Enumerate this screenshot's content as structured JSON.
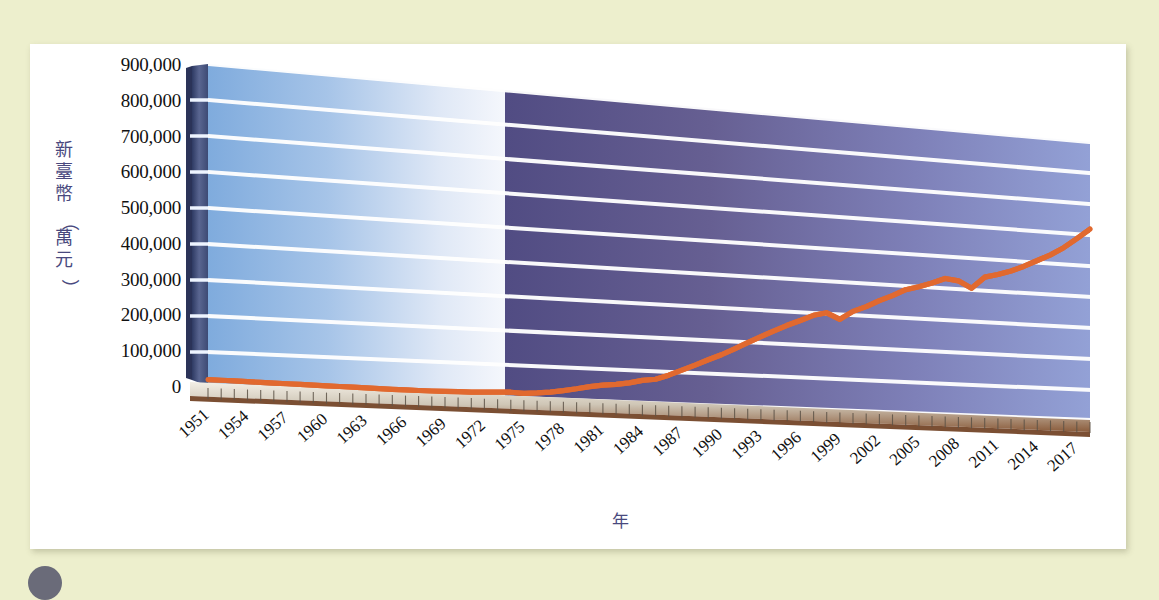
{
  "page": {
    "background_color": "#edefcd",
    "card_color": "#ffffff"
  },
  "chart_data": {
    "type": "line",
    "title": "",
    "subtitle": "",
    "xlabel": "年",
    "ylabel": "新臺幣（萬元）",
    "ylabel_chars": [
      "新",
      "臺",
      "幣",
      "（",
      "萬",
      "元",
      "）"
    ],
    "ylim": [
      0,
      900000
    ],
    "ytick_step": 100000,
    "ytick_labels": [
      "900,000",
      "800,000",
      "700,000",
      "600,000",
      "500,000",
      "400,000",
      "300,000",
      "200,000",
      "100,000",
      "0"
    ],
    "ytick_values": [
      900000,
      800000,
      700000,
      600000,
      500000,
      400000,
      300000,
      200000,
      100000,
      0
    ],
    "xtick_labels": [
      "1951",
      "1954",
      "1957",
      "1960",
      "1963",
      "1966",
      "1969",
      "1972",
      "1975",
      "1978",
      "1981",
      "1984",
      "1987",
      "1990",
      "1993",
      "1996",
      "1999",
      "2002",
      "2005",
      "2008",
      "2011",
      "2014",
      "2017"
    ],
    "xlim": [
      1951,
      2018
    ],
    "grid": true,
    "legend": "none",
    "series_color": "#e1692f",
    "series": [
      {
        "name": "新臺幣（萬元）",
        "x": [
          1951,
          1952,
          1953,
          1954,
          1955,
          1956,
          1957,
          1958,
          1959,
          1960,
          1961,
          1962,
          1963,
          1964,
          1965,
          1966,
          1967,
          1968,
          1969,
          1970,
          1971,
          1972,
          1973,
          1974,
          1975,
          1976,
          1977,
          1978,
          1979,
          1980,
          1981,
          1982,
          1983,
          1984,
          1985,
          1986,
          1987,
          1988,
          1989,
          1990,
          1991,
          1992,
          1993,
          1994,
          1995,
          1996,
          1997,
          1998,
          1999,
          2000,
          2001,
          2002,
          2003,
          2004,
          2005,
          2006,
          2007,
          2008,
          2009,
          2010,
          2011,
          2012,
          2013,
          2014,
          2015,
          2016,
          2017,
          2018
        ],
        "values": [
          18000,
          17500,
          17000,
          16500,
          16000,
          15500,
          15000,
          14500,
          14000,
          13500,
          13000,
          12500,
          12000,
          11500,
          11000,
          10500,
          10500,
          10500,
          11000,
          11500,
          12000,
          13000,
          15000,
          16000,
          14000,
          17000,
          21000,
          27000,
          34000,
          42000,
          48000,
          52000,
          58000,
          67000,
          72000,
          86000,
          103000,
          120000,
          138000,
          155000,
          175000,
          196000,
          216000,
          236000,
          255000,
          272000,
          290000,
          300000,
          282000,
          309000,
          326000,
          347000,
          365000,
          386000,
          398000,
          412000,
          429000,
          424000,
          403000,
          441000,
          452000,
          466000,
          484000,
          505000,
          526000,
          552000,
          584000,
          618000
        ]
      }
    ],
    "panel": {
      "left_band_color_start": "#8ab3e0",
      "left_band_color_end": "#f2f5fb",
      "right_band_color_start": "#544f86",
      "right_band_color_end": "#8e9cd4",
      "gridline_color": "#ffffff",
      "left_wall_color": "#4a5580",
      "floor_color": "#8a5a3c"
    }
  }
}
